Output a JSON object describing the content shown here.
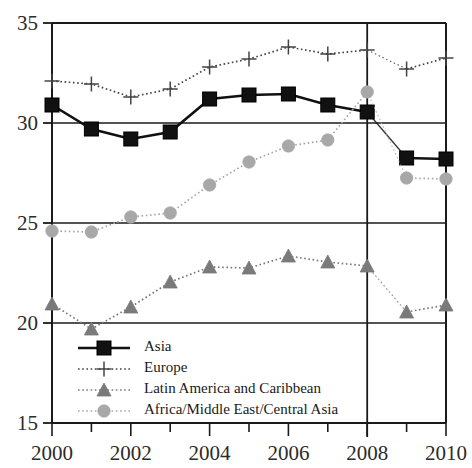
{
  "chart_data": {
    "type": "line",
    "title": "",
    "subtitle": "",
    "xlabel": "",
    "ylabel": "",
    "x": [
      2000,
      2001,
      2002,
      2003,
      2004,
      2005,
      2006,
      2007,
      2008,
      2009,
      2010
    ],
    "xtick_labels": [
      "2000",
      "2002",
      "2004",
      "2006",
      "2008",
      "2010"
    ],
    "xtick_values": [
      2000,
      2002,
      2004,
      2006,
      2008,
      2010
    ],
    "xlim": [
      2000,
      2010
    ],
    "ylim": [
      15,
      35
    ],
    "ytick_labels": [
      "15",
      "20",
      "25",
      "30",
      "35"
    ],
    "ytick_values": [
      15,
      20,
      25,
      30,
      35
    ],
    "grid": "horizontal-at-y-ticks",
    "legend_position": "lower-left-inside",
    "annotations": [
      {
        "name": "vertical-reference-line",
        "x": 2008
      }
    ],
    "series": [
      {
        "name": "Asia",
        "marker": "filled-square",
        "color": "#111111",
        "linestyle": "solid",
        "values": [
          30.9,
          29.7,
          29.2,
          29.55,
          31.2,
          31.4,
          31.45,
          30.9,
          30.55,
          28.25,
          28.2
        ]
      },
      {
        "name": "Europe",
        "marker": "plus",
        "color": "#444444",
        "linestyle": "dotted",
        "values": [
          32.1,
          31.95,
          31.3,
          31.7,
          32.8,
          33.2,
          33.8,
          33.45,
          33.65,
          32.7,
          33.25
        ]
      },
      {
        "name": "Latin America and Caribbean",
        "marker": "filled-triangle",
        "color": "#7a7a7a",
        "linestyle": "dotted",
        "values": [
          20.95,
          19.7,
          20.8,
          22.05,
          22.8,
          22.75,
          23.35,
          23.05,
          22.85,
          20.55,
          20.9
        ]
      },
      {
        "name": "Africa/Middle East/Central Asia",
        "marker": "filled-circle",
        "color": "#a8a8a8",
        "linestyle": "dotted",
        "values": [
          24.6,
          24.55,
          25.3,
          25.5,
          26.9,
          28.05,
          28.85,
          29.15,
          31.55,
          27.25,
          27.2
        ]
      }
    ]
  },
  "legend": {
    "items": [
      {
        "label": "Asia"
      },
      {
        "label": "Europe"
      },
      {
        "label": "Latin America and Caribbean"
      },
      {
        "label": "Africa/Middle East/Central Asia"
      }
    ]
  },
  "axis": {
    "y_labels": [
      "35",
      "30",
      "25",
      "20",
      "15"
    ],
    "x_labels": [
      "2000",
      "2002",
      "2004",
      "2006",
      "2008",
      "2010"
    ]
  }
}
